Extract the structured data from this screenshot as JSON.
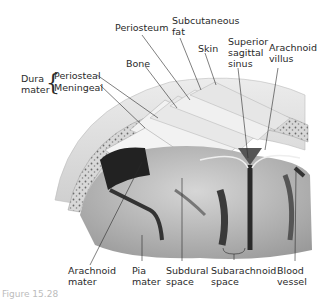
{
  "diagram": {
    "labels": {
      "dura_mater": "Dura\nmater",
      "periosteal": "Periosteal",
      "meningeal": "Meningeal",
      "bone": "Bone",
      "periosteum": "Periosteum",
      "subcutaneous_fat": "Subcutaneous\nfat",
      "skin": "Skin",
      "superior_sagittal_sinus": "Superior\nsagittal\nsinus",
      "arachnoid_villus": "Arachnoid\nvillus",
      "arachnoid_mater": "Arachnoid\nmater",
      "pia_mater": "Pia\nmater",
      "subdural_space": "Subdural\nspace",
      "subarachnoid_space": "Subarachnoid\nspace",
      "blood_vessel": "Blood\nvessel"
    },
    "caption": "Figure 15.28"
  },
  "colors": {
    "skin": "#e4e4e4",
    "bone": "#eeeeee",
    "diploe": "#b8b8b8",
    "brain": "#c8c8c8",
    "sulcus": "#3a3a3a",
    "leader": "#2a2a2a"
  }
}
